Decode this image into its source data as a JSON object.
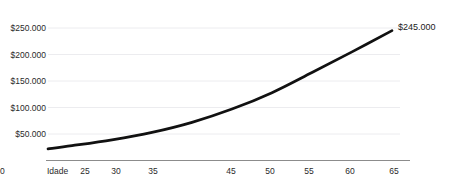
{
  "top_caption": "",
  "axis": {
    "x_title": "Idade",
    "y_ticks": [
      "$50.000",
      "$100.000",
      "$150.000",
      "$200.000",
      "$250.000"
    ],
    "x_ticks": [
      "25",
      "30",
      "35",
      "40",
      "45",
      "50",
      "55",
      "60",
      "65"
    ]
  },
  "annotation": {
    "end_value_label": "$245.000"
  },
  "colors": {
    "line": "#111111",
    "grid": "#ebebee",
    "axis": "#8c8c8c",
    "text": "#2a2a2a",
    "background": "#ffffff"
  },
  "chart_data": {
    "type": "line",
    "title": "",
    "subtitle": "",
    "xlabel": "Idade",
    "ylabel": "",
    "xlim": [
      22,
      66
    ],
    "ylim": [
      0,
      270000
    ],
    "grid": true,
    "legend": false,
    "legend_position": "none",
    "x_tick_values": [
      25,
      30,
      35,
      40,
      45,
      50,
      55,
      60,
      65
    ],
    "y_tick_values": [
      50000,
      100000,
      150000,
      200000,
      250000
    ],
    "y_tick_labels": [
      "$50.000",
      "$100.000",
      "$150.000",
      "$200.000",
      "$250.000"
    ],
    "series": [
      {
        "name": "Patrimônio acumulado",
        "x": [
          22,
          25,
          30,
          35,
          40,
          45,
          50,
          55,
          60,
          65
        ],
        "values": [
          22000,
          28000,
          39000,
          53000,
          72000,
          97000,
          128000,
          166000,
          205000,
          245000
        ]
      }
    ],
    "annotations": [
      {
        "text": "$245.000",
        "x": 65,
        "y": 245000
      }
    ]
  }
}
